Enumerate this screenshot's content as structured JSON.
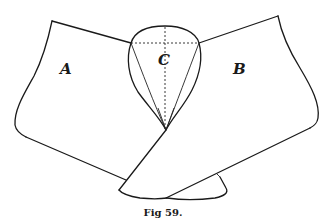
{
  "figure": {
    "caption": "Fig 59.",
    "labels": {
      "a": "A",
      "b": "B",
      "c": "C"
    }
  }
}
